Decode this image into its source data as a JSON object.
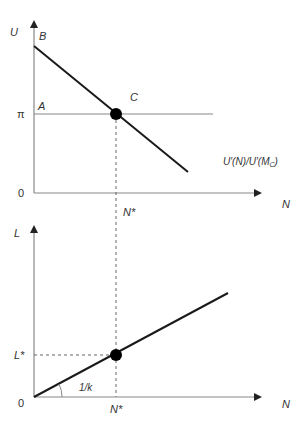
{
  "top_panel": {
    "y_axis_label": "U",
    "x_axis_label": "N",
    "origin_label": "0",
    "pi_tick_label": "π",
    "point_A_label": "A",
    "point_B_label": "B",
    "point_C_label": "C",
    "curve_label": "U′(N)/U′(M",
    "curve_label_sub": "C",
    "curve_label_close": ")",
    "n_star_label": "N*"
  },
  "bottom_panel": {
    "y_axis_label": "L",
    "x_axis_label": "N",
    "origin_label": "0",
    "l_star_label": "L*",
    "n_star_label": "N*",
    "slope_label": "1/k"
  },
  "colors": {
    "axis": "#888888",
    "line": "#1a1a1a",
    "point": "#000000",
    "dashed": "#666666",
    "text": "#333333"
  }
}
